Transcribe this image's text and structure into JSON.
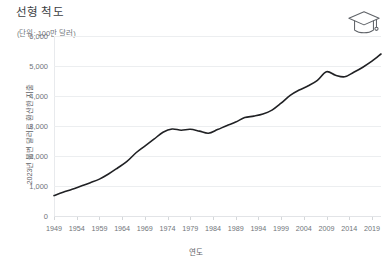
{
  "chart_data": {
    "type": "line",
    "title": "선형 척도",
    "subtitle": "(단위: 100만 달러)",
    "xlabel": "연도",
    "ylabel": "2023년 불변 달러로 환산한 지출",
    "grid": true,
    "legend": false,
    "xlim": [
      1949,
      2021
    ],
    "ylim": [
      0,
      6000
    ],
    "ytick_labels": [
      "6,000",
      "5,000",
      "4,000",
      "3,000",
      "2,000",
      "1,000",
      "0"
    ],
    "ytick_values": [
      6000,
      5000,
      4000,
      3000,
      2000,
      1000,
      0
    ],
    "xtick_labels": [
      "1949",
      "1954",
      "1959",
      "1964",
      "1969",
      "1974",
      "1979",
      "1984",
      "1989",
      "1994",
      "1999",
      "2004",
      "2009",
      "2014",
      "2019"
    ],
    "xtick_values": [
      1949,
      1954,
      1959,
      1964,
      1969,
      1974,
      1979,
      1984,
      1989,
      1994,
      1999,
      2004,
      2009,
      2014,
      2019
    ],
    "series": [
      {
        "name": "지출",
        "color": "#202124",
        "x": [
          1949,
          1951,
          1953,
          1955,
          1957,
          1959,
          1961,
          1963,
          1965,
          1967,
          1969,
          1971,
          1973,
          1975,
          1977,
          1979,
          1981,
          1983,
          1985,
          1987,
          1989,
          1991,
          1993,
          1995,
          1997,
          1999,
          2001,
          2003,
          2005,
          2007,
          2009,
          2011,
          2013,
          2015,
          2017,
          2019,
          2021
        ],
        "values": [
          680,
          790,
          890,
          1000,
          1110,
          1230,
          1400,
          1600,
          1810,
          2100,
          2330,
          2560,
          2790,
          2900,
          2860,
          2890,
          2830,
          2760,
          2880,
          3010,
          3130,
          3280,
          3330,
          3400,
          3530,
          3760,
          4020,
          4200,
          4340,
          4520,
          4810,
          4690,
          4640,
          4790,
          4960,
          5160,
          5400
        ]
      }
    ]
  },
  "icons": {
    "graduation_cap": "graduation-cap-icon"
  },
  "colors": {
    "line": "#202124",
    "grid": "#eceef0",
    "tick_text": "#70757a",
    "title_text": "#3c4043",
    "axis_title_text": "#5f6368"
  }
}
